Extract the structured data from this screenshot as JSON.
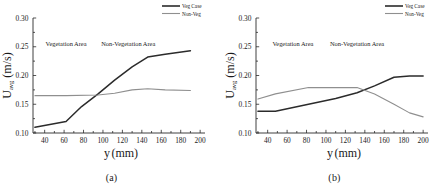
{
  "figure": {
    "panels": [
      {
        "caption": "(a)",
        "annotations": [
          {
            "text": "Vegetation Area",
            "x": 62,
            "y": 0.251
          },
          {
            "text": "Non-Vegetation Area",
            "x": 126,
            "y": 0.251
          }
        ]
      },
      {
        "caption": "(b)",
        "annotations": [
          {
            "text": "Vegetation Area",
            "x": 66,
            "y": 0.251
          },
          {
            "text": "Non-Vegetation Area",
            "x": 132,
            "y": 0.251
          }
        ]
      }
    ]
  },
  "colors": {
    "veg_case": "#2b2b2b",
    "non_veg": "#8f8f8f",
    "axis": "#2b2b2b",
    "background": "#ffffff"
  },
  "chart_data": [
    {
      "type": "line",
      "title": "(a)",
      "xlabel": "y (mm)",
      "ylabel": "U_avg (m/s)",
      "ylabel_main": "U",
      "ylabel_sub": "avg",
      "ylabel_unit": " (m/s)",
      "xlim": [
        28,
        205
      ],
      "ylim": [
        0.1,
        0.3
      ],
      "xticks": [
        40,
        60,
        80,
        100,
        120,
        140,
        160,
        180,
        200
      ],
      "yticks": [
        0.1,
        0.15,
        0.2,
        0.25,
        0.3
      ],
      "ytick_labels": [
        "0.10",
        "0.15",
        "0.20",
        "0.25",
        "0.30"
      ],
      "xtick_labels": [
        "40",
        "60",
        "80",
        "100",
        "120",
        "140",
        "160",
        "180",
        "200"
      ],
      "grid": false,
      "legend_position": "top-right",
      "series": [
        {
          "name": "Veg Case",
          "color": "#2b2b2b",
          "x": [
            30,
            62,
            78,
            95,
            112,
            130,
            146,
            164,
            190
          ],
          "values": [
            0.11,
            0.12,
            0.146,
            0.168,
            0.192,
            0.215,
            0.232,
            0.237,
            0.243
          ]
        },
        {
          "name": "Non-Veg",
          "color": "#8f8f8f",
          "x": [
            30,
            62,
            95,
            112,
            130,
            146,
            164,
            190
          ],
          "values": [
            0.165,
            0.165,
            0.166,
            0.169,
            0.175,
            0.177,
            0.175,
            0.174
          ]
        }
      ]
    },
    {
      "type": "line",
      "title": "(b)",
      "xlabel": "y (mm)",
      "ylabel": "U_avg (m/s)",
      "ylabel_main": "U",
      "ylabel_sub": "avg",
      "ylabel_unit": " (m/s)",
      "xlim": [
        28,
        205
      ],
      "ylim": [
        0.1,
        0.3
      ],
      "xticks": [
        40,
        60,
        80,
        100,
        120,
        140,
        160,
        180,
        200
      ],
      "yticks": [
        0.1,
        0.15,
        0.2,
        0.25,
        0.3
      ],
      "ytick_labels": [
        "0.10",
        "0.15",
        "0.20",
        "0.25",
        "0.30"
      ],
      "xtick_labels": [
        "40",
        "60",
        "80",
        "100",
        "120",
        "140",
        "160",
        "180",
        "200"
      ],
      "grid": false,
      "legend_position": "top-right",
      "series": [
        {
          "name": "Veg Case",
          "color": "#2b2b2b",
          "x": [
            30,
            48,
            82,
            110,
            132,
            150,
            170,
            186,
            200
          ],
          "values": [
            0.138,
            0.138,
            0.15,
            0.16,
            0.17,
            0.182,
            0.197,
            0.199,
            0.199
          ]
        },
        {
          "name": "Non-Veg",
          "color": "#8f8f8f",
          "x": [
            30,
            48,
            82,
            110,
            132,
            150,
            170,
            186,
            200
          ],
          "values": [
            0.159,
            0.168,
            0.179,
            0.179,
            0.179,
            0.168,
            0.15,
            0.135,
            0.128
          ]
        }
      ]
    }
  ],
  "legend": {
    "entries": [
      {
        "label": "Veg Case",
        "color": "#2b2b2b"
      },
      {
        "label": "Non-Veg",
        "color": "#8f8f8f"
      }
    ]
  }
}
